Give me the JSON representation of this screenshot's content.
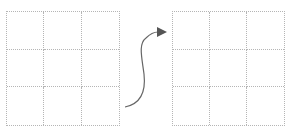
{
  "diagram": {
    "left_grid": {
      "rows": 3,
      "cols": 3,
      "cells": [
        "",
        "",
        "",
        "",
        "",
        "",
        "",
        "",
        ""
      ]
    },
    "right_grid": {
      "rows": 3,
      "cols": 3,
      "cells": [
        "",
        "",
        "",
        "",
        "",
        "",
        "",
        "",
        ""
      ]
    },
    "arrow": {
      "direction": "left-to-right",
      "style": "s-curve",
      "color": "#666666"
    },
    "colors": {
      "grid_line": "#b5b5b5",
      "background": "#ffffff",
      "arrow": "#666666"
    }
  }
}
